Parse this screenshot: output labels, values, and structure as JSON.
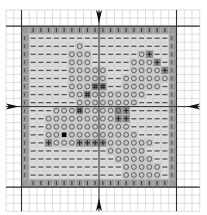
{
  "pattern": {
    "title": "Cross-stitch chart",
    "grid": {
      "origin_x": 6,
      "origin_y": 10,
      "cell_w": 7.75,
      "cell_h": 8.05,
      "outer_cols": 25,
      "outer_rows": 25,
      "box_start_col": 2,
      "box_start_row": 2,
      "box_size": 20,
      "center_col": 12,
      "center_row": 12
    },
    "colors": {
      "grid_line": "#c8c8c8",
      "bold_line": "#303030",
      "border_fill": "#9a9a9a",
      "background_fill": "#dcdcdc",
      "shape_fill": "#c9c9c9",
      "accent_fill": "#8a8a8a",
      "symbol": "#3a3a3a"
    },
    "legend": {
      "-": "background",
      "o": "main-shape",
      "#": "dark-detail",
      "+": "outline-stitch",
      "B": "solid-black",
      "|": "border"
    },
    "rows": [
      "------------------",
      "------o-----------",
      "-----ooo------o+---",
      "-----ooo-----ooo+-",
      "-----ooooo---oooo+",
      "-----ooooo--oooooo",
      "-----ooo##--ooooo-",
      "-----oo#ooooooo---",
      "------oooooooo----",
      "---ooo#ooooo+-----",
      "--ooooooooo++-----",
      "--ooooooooooo-----",
      "--ooBooooooooo----",
      "--+ooo++++oooooo--",
      "----------ooooo---",
      "-----------ooooo--",
      "------------ooooo-",
      "------------ooooo-"
    ],
    "dark_cells": [
      [
        2,
        15
      ],
      [
        3,
        16
      ],
      [
        4,
        17
      ],
      [
        6,
        8
      ],
      [
        6,
        9
      ],
      [
        7,
        7
      ],
      [
        9,
        6
      ],
      [
        9,
        11
      ],
      [
        9,
        12
      ],
      [
        10,
        11
      ],
      [
        10,
        12
      ],
      [
        13,
        2
      ],
      [
        13,
        6
      ],
      [
        13,
        7
      ],
      [
        13,
        8
      ],
      [
        13,
        9
      ]
    ],
    "arrows": [
      "top",
      "bottom",
      "left",
      "right"
    ]
  }
}
